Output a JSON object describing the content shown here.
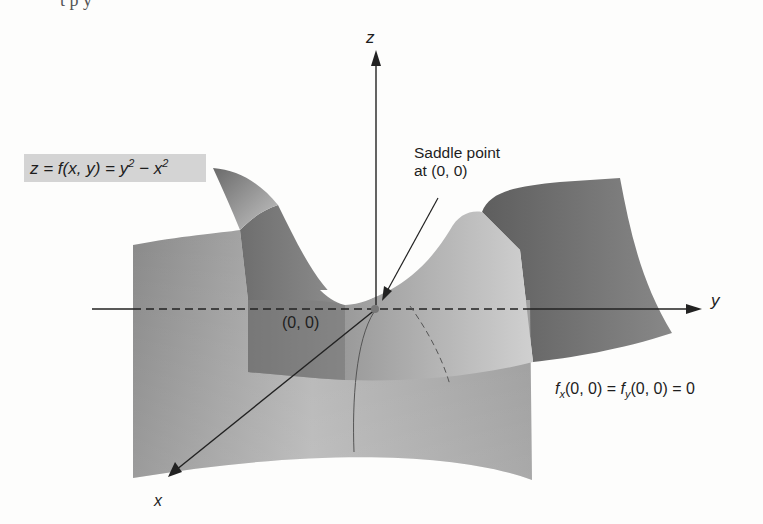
{
  "figure": {
    "title_fragment": "t      p          y",
    "surface_equation": {
      "lhs": "z = f(x, y) = y",
      "exp1": "2",
      "mid": " − x",
      "exp2": "2"
    },
    "saddle_annotation": {
      "line1": "Saddle point",
      "line2": "at (0, 0)"
    },
    "origin_label": "(0, 0)",
    "partials_label": {
      "f1": "f",
      "sub1": "x",
      "mid": "(0, 0) = ",
      "f2": "f",
      "sub2": "y",
      "end": "(0, 0) = 0"
    },
    "axes": {
      "x": "x",
      "y": "y",
      "z": "z"
    },
    "colors": {
      "background": "#fdfdfc",
      "label_box": "#d4d4d4",
      "surface_dark": "#6f6f6f",
      "surface_mid": "#9a9a9a",
      "surface_light": "#c8c8c8",
      "axis": "#222222"
    }
  }
}
